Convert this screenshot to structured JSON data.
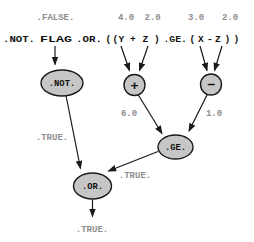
{
  "colors": {
    "background": "#ffffff",
    "node_fill": "#c6c6c6",
    "node_border": "#1a1a1a",
    "gray_text": "#8e8e8e",
    "black_text": "#111111"
  },
  "operand_values": {
    "flag": ".FALSE.",
    "y": "4.0",
    "z1": "2.0",
    "x": "3.0",
    "z2": "2.0"
  },
  "expression": {
    "full": ".NOT. FLAG .OR. ( ( Y + Z ) .GE. ( X - Z ) )",
    "tokens": [
      ".NOT.",
      "FLAG",
      ".OR.",
      "(",
      "(",
      "Y",
      "+",
      "Z",
      ")",
      ".GE.",
      "(",
      "X",
      "-",
      "Z",
      ")",
      ")"
    ]
  },
  "nodes": {
    "not": ".NOT.",
    "plus": "+",
    "minus": "−",
    "ge": ".GE.",
    "or": ".OR."
  },
  "results": {
    "not_result": ".TRUE.",
    "plus_result": "6.0",
    "minus_result": "1.0",
    "ge_result": ".TRUE.",
    "final_result": ".TRUE."
  }
}
